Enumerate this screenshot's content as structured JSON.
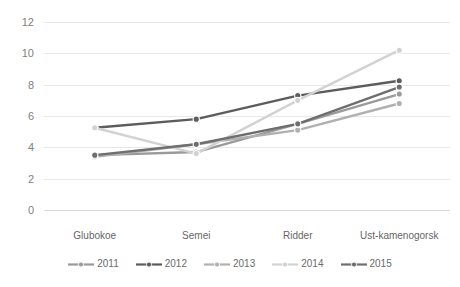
{
  "chart_data": {
    "type": "line",
    "title": "",
    "xlabel": "",
    "ylabel": "",
    "categories": [
      "Glubokoe",
      "Semei",
      "Ridder",
      "Ust-kamenogorsk"
    ],
    "ylim": [
      0,
      12
    ],
    "yticks": [
      0,
      2,
      4,
      6,
      8,
      10,
      12
    ],
    "grid": true,
    "legend_position": "bottom",
    "series": [
      {
        "name": "2011",
        "values": [
          3.5,
          3.7,
          5.5,
          7.4
        ],
        "color": "#9a9a9a"
      },
      {
        "name": "2012",
        "values": [
          5.25,
          5.8,
          7.3,
          8.25
        ],
        "color": "#5c5c5c"
      },
      {
        "name": "2013",
        "values": [
          3.4,
          4.2,
          5.1,
          6.8
        ],
        "color": "#b0b0b0"
      },
      {
        "name": "2014",
        "values": [
          5.25,
          3.6,
          7.0,
          10.2
        ],
        "color": "#d2d2d2"
      },
      {
        "name": "2015",
        "values": [
          3.5,
          4.2,
          5.5,
          7.85
        ],
        "color": "#6e6e6e"
      }
    ]
  },
  "legend": {
    "items": [
      {
        "label": "2011"
      },
      {
        "label": "2012"
      },
      {
        "label": "2013"
      },
      {
        "label": "2014"
      },
      {
        "label": "2015"
      }
    ]
  }
}
